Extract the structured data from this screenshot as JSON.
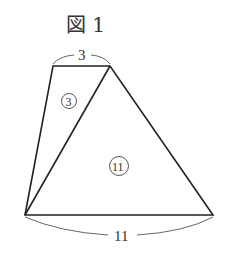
{
  "figure": {
    "title": "図 1",
    "top_length": "3",
    "bottom_length": "11",
    "small_triangle_area": "3",
    "large_triangle_area": "11"
  },
  "colors": {
    "stroke": "#222222",
    "label": "#333333"
  }
}
